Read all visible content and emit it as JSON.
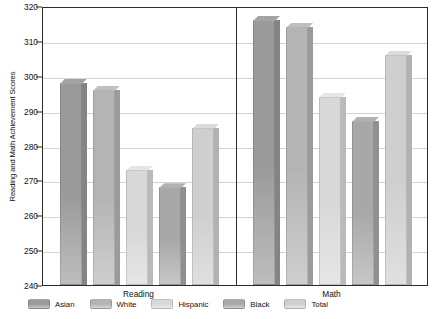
{
  "chart_data": {
    "type": "bar",
    "title": "",
    "xlabel": "",
    "ylabel": "Reading and Math Achievement Scores",
    "categories": [
      "Reading",
      "Math"
    ],
    "ylim": [
      240,
      320
    ],
    "yticks": [
      240,
      250,
      260,
      270,
      280,
      290,
      300,
      310,
      320
    ],
    "grid": true,
    "legend_position": "bottom",
    "series": [
      {
        "name": "Asian",
        "color": "#9a9a9a",
        "values": [
          298,
          316
        ]
      },
      {
        "name": "White",
        "color": "#b4b4b4",
        "values": [
          296,
          314
        ]
      },
      {
        "name": "Hispanic",
        "color": "#d8d8d8",
        "values": [
          273,
          294
        ]
      },
      {
        "name": "Black",
        "color": "#a8a8a8",
        "values": [
          268,
          287
        ]
      },
      {
        "name": "Total",
        "color": "#cfcfcf",
        "values": [
          285,
          306
        ]
      }
    ]
  },
  "axis": {
    "y_title": "Reading and Math Achievement Scores",
    "y_labels": [
      "320",
      "310",
      "300",
      "290",
      "280",
      "270",
      "260",
      "250",
      "240"
    ],
    "group_labels": [
      "Reading",
      "Math"
    ]
  },
  "legend": {
    "items": [
      {
        "label": "Asian"
      },
      {
        "label": "White"
      },
      {
        "label": "Hispanic"
      },
      {
        "label": "Black"
      },
      {
        "label": "Total"
      }
    ]
  }
}
